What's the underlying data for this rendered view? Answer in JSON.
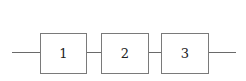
{
  "diagram": {
    "type": "series-block-diagram",
    "blocks": [
      {
        "label": "1"
      },
      {
        "label": "2"
      },
      {
        "label": "3"
      }
    ],
    "colors": {
      "stroke": "#7a7a7a",
      "text": "#222222",
      "background": "#ffffff"
    }
  }
}
